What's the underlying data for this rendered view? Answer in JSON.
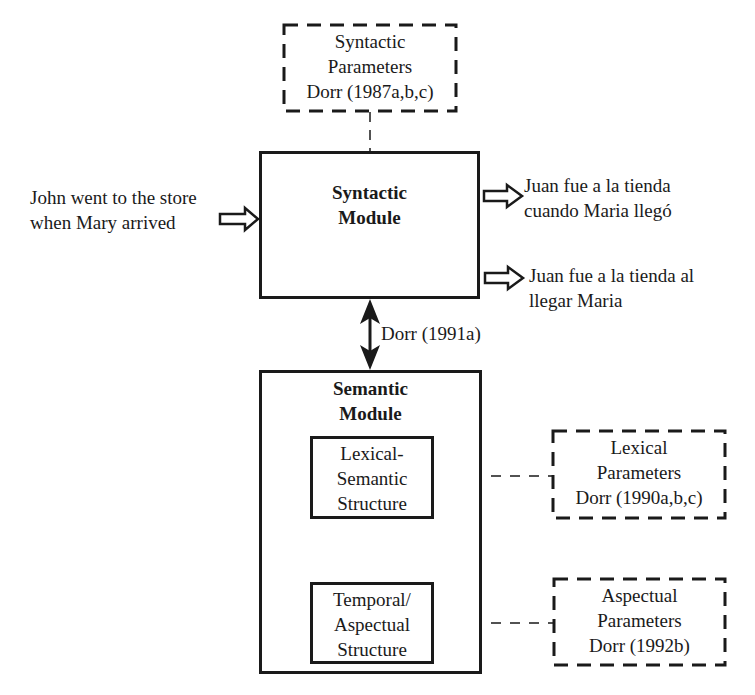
{
  "diagram": {
    "syntactic_parameters": {
      "lines": [
        "Syntactic",
        "Parameters",
        "Dorr (1987a,b,c)"
      ]
    },
    "syntactic_module": {
      "lines": [
        "Syntactic",
        "Module"
      ]
    },
    "input_sentence": {
      "lines": [
        "John went to the store",
        "when Mary arrived"
      ]
    },
    "outputs": [
      {
        "lines": [
          "Juan fue a la tienda",
          "cuando Maria llegó"
        ]
      },
      {
        "lines": [
          "Juan fue a la tienda al",
          "llegar Maria"
        ]
      }
    ],
    "link_label": "Dorr (1991a)",
    "semantic_module": {
      "lines": [
        "Semantic",
        "Module"
      ],
      "lexical_semantic_structure": {
        "lines": [
          "Lexical-",
          "Semantic",
          "Structure"
        ]
      },
      "temporal_aspectual_structure": {
        "lines": [
          "Temporal/",
          "Aspectual",
          "Structure"
        ]
      }
    },
    "lexical_parameters": {
      "lines": [
        "Lexical",
        "Parameters",
        "Dorr (1990a,b,c)"
      ]
    },
    "aspectual_parameters": {
      "lines": [
        "Aspectual",
        "Parameters",
        "Dorr (1992b)"
      ]
    }
  },
  "colors": {
    "ink": "#1a1a1a",
    "background": "#ffffff"
  }
}
